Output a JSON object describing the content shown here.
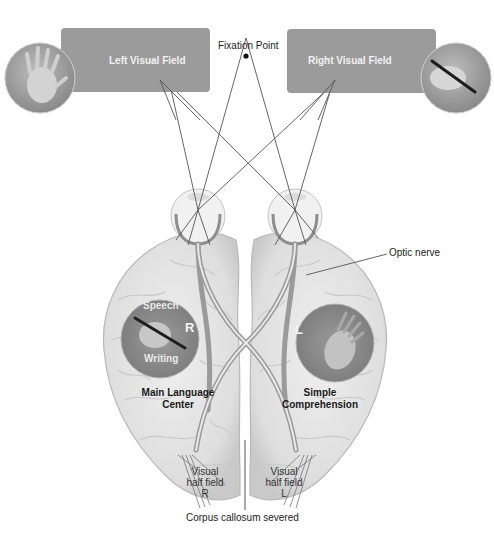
{
  "figure": {
    "fixation_point": {
      "label": "Fixation Point"
    },
    "visual_fields": [
      {
        "id": "left",
        "label": "Left Visual Field",
        "image": "left-hand-icon"
      },
      {
        "id": "right",
        "label": "Right Visual Field",
        "image": "hand-holding-pen-icon"
      }
    ],
    "hemispheres": {
      "left": {
        "region_label_line1": "Main Language",
        "region_label_line2": "Center",
        "circle_top_label": "Speech",
        "circle_bottom_label": "Writing",
        "circle_letter": "R",
        "visual_half_field": [
          "Visual",
          "half field",
          "R"
        ]
      },
      "right": {
        "region_label_line1": "Simple",
        "region_label_line2": "Comprehension",
        "circle_letter": "L",
        "visual_half_field": [
          "Visual",
          "half field",
          "L"
        ]
      }
    },
    "annotations": {
      "optic_nerve": "Optic nerve",
      "corpus_callosum": "Corpus callosum severed"
    },
    "colors": {
      "field_box": "#9b9b9b",
      "brain_fill": "#e6e6e6",
      "brain_stroke": "#bdbdbd",
      "circle_fill": "#8c8c8c",
      "line": "#555555"
    }
  }
}
